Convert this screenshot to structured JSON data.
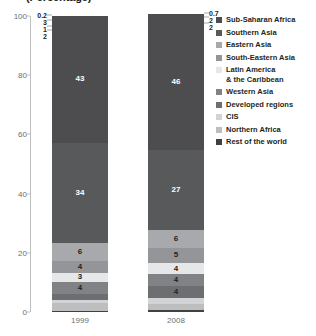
{
  "chart": {
    "title": "(Percentage)",
    "ylabel": "",
    "xlabel": ""
  },
  "chart_data": {
    "type": "bar",
    "title": "(Percentage)",
    "xlabel": "",
    "ylabel": "",
    "ylim": [
      0,
      100
    ],
    "grid": false,
    "stacked": true,
    "legend_position": "right",
    "categories": [
      "1999",
      "2008"
    ],
    "ytick_labels": [
      "0",
      "20",
      "40",
      "60",
      "80",
      "100"
    ],
    "ytick_values": [
      0,
      20,
      40,
      60,
      80,
      100
    ],
    "series": [
      {
        "name": "Sub-Saharan Africa",
        "values": [
          43,
          46
        ],
        "color": "#4d4d4f"
      },
      {
        "name": "Southern Asia",
        "values": [
          34,
          27
        ],
        "color": "#58595b"
      },
      {
        "name": "Eastern Asia",
        "values": [
          6,
          6
        ],
        "color": "#a7a9ac"
      },
      {
        "name": "South-Eastern Asia",
        "values": [
          4,
          5
        ],
        "color": "#939598"
      },
      {
        "name": "Latin America\n& the Caribbean",
        "values": [
          3,
          4
        ],
        "color": "#e6e7e8"
      },
      {
        "name": "Western Asia",
        "values": [
          4,
          4
        ],
        "color": "#808285"
      },
      {
        "name": "Developed regions",
        "values": [
          2,
          4
        ],
        "color": "#6d6e71"
      },
      {
        "name": "CIS",
        "values": [
          1,
          2
        ],
        "color": "#d1d3d4"
      },
      {
        "name": "Northern Africa",
        "values": [
          3,
          2
        ],
        "color": "#bcbec0"
      },
      {
        "name": "Rest of the world",
        "values": [
          0.2,
          0.7
        ],
        "color": "#414042"
      }
    ]
  },
  "bars": {
    "bar1": {
      "year": "1999",
      "segments": [
        {
          "label": "43",
          "value": 43,
          "color": "#4d4d4f",
          "text": "light",
          "inside": true
        },
        {
          "label": "34",
          "value": 34,
          "color": "#58595b",
          "text": "light",
          "inside": true
        },
        {
          "label": "6",
          "value": 6,
          "color": "#a7a9ac",
          "text": "dark",
          "inside": true
        },
        {
          "label": "4",
          "value": 4,
          "color": "#939598",
          "text": "dark",
          "inside": true
        },
        {
          "label": "3",
          "value": 3,
          "color": "#e6e7e8",
          "text": "dark",
          "inside": true
        },
        {
          "label": "4",
          "value": 4,
          "color": "#808285",
          "text": "dark",
          "inside": true
        },
        {
          "label": "2",
          "value": 2,
          "color": "#6d6e71",
          "text": "dark",
          "inside": false
        },
        {
          "label": "1",
          "value": 1,
          "color": "#d1d3d4",
          "text": "dark",
          "inside": false
        },
        {
          "label": "3",
          "value": 3,
          "color": "#bcbec0",
          "text": "dark",
          "inside": false
        },
        {
          "label": "0.2",
          "value": 0.2,
          "color": "#414042",
          "text": "dark",
          "inside": false
        }
      ]
    },
    "bar2": {
      "year": "2008",
      "segments": [
        {
          "label": "46",
          "value": 46,
          "color": "#4d4d4f",
          "text": "light",
          "inside": true
        },
        {
          "label": "27",
          "value": 27,
          "color": "#58595b",
          "text": "light",
          "inside": true
        },
        {
          "label": "6",
          "value": 6,
          "color": "#a7a9ac",
          "text": "dark",
          "inside": true
        },
        {
          "label": "5",
          "value": 5,
          "color": "#939598",
          "text": "dark",
          "inside": true
        },
        {
          "label": "4",
          "value": 4,
          "color": "#e6e7e8",
          "text": "dark",
          "inside": true
        },
        {
          "label": "4",
          "value": 4,
          "color": "#808285",
          "text": "dark",
          "inside": true
        },
        {
          "label": "4",
          "value": 4,
          "color": "#6d6e71",
          "text": "dark",
          "inside": true
        },
        {
          "label": "2",
          "value": 2,
          "color": "#d1d3d4",
          "text": "dark",
          "inside": false
        },
        {
          "label": "2",
          "value": 2,
          "color": "#bcbec0",
          "text": "dark",
          "inside": false
        },
        {
          "label": "0.7",
          "value": 0.7,
          "color": "#414042",
          "text": "dark",
          "inside": false
        }
      ]
    }
  },
  "legend": {
    "items": [
      {
        "label": "Sub-Saharan Africa",
        "color": "#4d4d4f"
      },
      {
        "label": "Southern Asia",
        "color": "#58595b"
      },
      {
        "label": "Eastern Asia",
        "color": "#a7a9ac"
      },
      {
        "label": "South-Eastern Asia",
        "color": "#939598"
      },
      {
        "label": "Latin America\n& the Caribbean",
        "color": "#e6e7e8"
      },
      {
        "label": "Western Asia",
        "color": "#808285"
      },
      {
        "label": "Developed regions",
        "color": "#6d6e71"
      },
      {
        "label": "CIS",
        "color": "#d1d3d4"
      },
      {
        "label": "Northern Africa",
        "color": "#bcbec0"
      },
      {
        "label": "Rest of the world",
        "color": "#414042"
      }
    ]
  }
}
